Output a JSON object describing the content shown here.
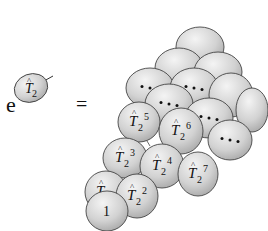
{
  "diagram": {
    "lhs": {
      "label_base": "T",
      "label_hat": "^",
      "label_sub": "2",
      "prefix": "e",
      "operator": "="
    },
    "ellipses": [
      {
        "cx": 200,
        "cy": 47,
        "rx": 24,
        "ry": 20,
        "text": "",
        "sup": ""
      },
      {
        "cx": 179,
        "cy": 68,
        "rx": 24,
        "ry": 20,
        "text": "",
        "sup": ""
      },
      {
        "cx": 218,
        "cy": 72,
        "rx": 24,
        "ry": 20,
        "text": "",
        "sup": ""
      },
      {
        "cx": 150,
        "cy": 88,
        "rx": 24,
        "ry": 20,
        "text": "dots",
        "sup": ""
      },
      {
        "cx": 194,
        "cy": 88,
        "rx": 24,
        "ry": 20,
        "text": "dots",
        "sup": ""
      },
      {
        "cx": 231,
        "cy": 95,
        "rx": 22,
        "ry": 22,
        "text": "",
        "sup": ""
      },
      {
        "cx": 252,
        "cy": 110,
        "rx": 16,
        "ry": 22,
        "text": "",
        "sup": ""
      },
      {
        "cx": 169,
        "cy": 104,
        "rx": 24,
        "ry": 20,
        "text": "dots",
        "sup": ""
      },
      {
        "cx": 209,
        "cy": 118,
        "rx": 24,
        "ry": 20,
        "text": "dots",
        "sup": ""
      },
      {
        "cx": 230,
        "cy": 140,
        "rx": 22,
        "ry": 20,
        "text": "dots",
        "sup": ""
      },
      {
        "cx": 139,
        "cy": 122,
        "rx": 21,
        "ry": 20,
        "text": "T",
        "sup": "5"
      },
      {
        "cx": 181,
        "cy": 131,
        "rx": 22,
        "ry": 23,
        "text": "T",
        "sup": "6"
      },
      {
        "cx": 125,
        "cy": 158,
        "rx": 22,
        "ry": 20,
        "text": "T",
        "sup": "3"
      },
      {
        "cx": 162,
        "cy": 166,
        "rx": 22,
        "ry": 22,
        "text": "T",
        "sup": "4"
      },
      {
        "cx": 198,
        "cy": 174,
        "rx": 20,
        "ry": 22,
        "text": "T",
        "sup": "7"
      },
      {
        "cx": 106,
        "cy": 192,
        "rx": 21,
        "ry": 21,
        "text": "T",
        "sup": ""
      },
      {
        "cx": 137,
        "cy": 196,
        "rx": 21,
        "ry": 22,
        "text": "T",
        "sup": "2"
      },
      {
        "cx": 107,
        "cy": 211,
        "rx": 21,
        "ry": 20,
        "text": "1",
        "sup": ""
      }
    ]
  }
}
